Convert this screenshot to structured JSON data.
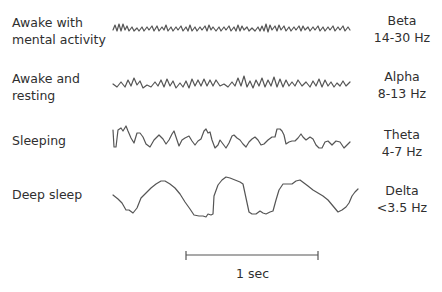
{
  "rows": [
    {
      "state": "Awake with mental activity",
      "state_line1": "Awake with",
      "state_line2": "mental activity",
      "band": "Beta",
      "freq": "14-30 Hz"
    },
    {
      "state": "Awake and resting",
      "state_line1": "Awake and",
      "state_line2": "resting",
      "band": "Alpha",
      "freq": "8-13 Hz"
    },
    {
      "state": "Sleeping",
      "state_line1": "Sleeping",
      "state_line2": "",
      "band": "Theta",
      "freq": "4-7 Hz"
    },
    {
      "state": "Deep sleep",
      "state_line1": "Deep sleep",
      "state_line2": "",
      "band": "Delta",
      "freq": "<3.5 Hz"
    }
  ],
  "scale_bar": {
    "label": "1 sec"
  },
  "colors": {
    "trace": "#555555",
    "text": "#2f2f2f",
    "background": "#ffffff"
  }
}
